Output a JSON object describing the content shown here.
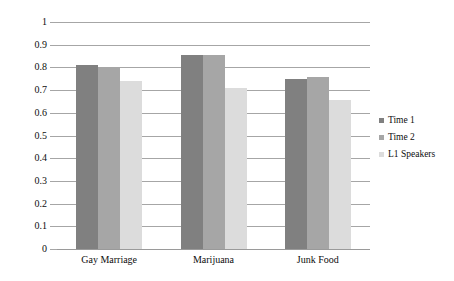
{
  "chart_data": {
    "type": "bar",
    "title": "",
    "subtitle": "",
    "xlabel": "",
    "ylabel": "",
    "categories": [
      "Gay Marriage",
      "Marijuana",
      "Junk Food"
    ],
    "series": [
      {
        "name": "Time 1",
        "values": [
          0.81,
          0.855,
          0.747
        ],
        "color": "#808080"
      },
      {
        "name": "Time 2",
        "values": [
          0.8,
          0.855,
          0.756
        ],
        "color": "#a6a6a6"
      },
      {
        "name": "L1 Speakers",
        "values": [
          0.74,
          0.71,
          0.655
        ],
        "color": "#dcdcdc"
      }
    ],
    "ylim": [
      0,
      1
    ],
    "ytick_labels": [
      "1",
      "0.9",
      "0.8",
      "0.7",
      "0.6",
      "0.5",
      "0.4",
      "0.3",
      "0.2",
      "0.1",
      "0"
    ],
    "ytick_values": [
      1,
      0.9,
      0.8,
      0.7,
      0.6,
      0.5,
      0.4,
      0.3,
      0.2,
      0.1,
      0
    ],
    "grid": true,
    "grid_axis": "y",
    "legend_position": "right",
    "gridline_color": "#a6a6a6",
    "background_color": "#ffffff",
    "text_color": "#0d0d0d"
  },
  "legend": {
    "items": [
      {
        "label": "Time 1",
        "swatch_color": "#808080",
        "marker": "square-marker"
      },
      {
        "label": "Time 2",
        "swatch_color": "#a6a6a6",
        "marker": "square-marker"
      },
      {
        "label": "L1 Speakers",
        "swatch_color": "#dcdcdc",
        "marker": "square-marker"
      }
    ]
  }
}
